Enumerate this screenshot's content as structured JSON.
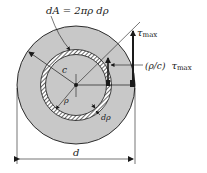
{
  "figure": {
    "labels": {
      "area_element": "dA = 2πρ dρ",
      "tau": "τ",
      "max_sub": "max",
      "radius_c": "c",
      "rho": "ρ",
      "d_rho": "dρ",
      "rho_over_c": "(ρ/c)",
      "diameter": "d"
    },
    "colors": {
      "shaft_fill": "#c8c8c8",
      "outline": "#1a1a1a",
      "ring_fill": "#ffffff",
      "hatch": "#1a1a1a"
    }
  }
}
